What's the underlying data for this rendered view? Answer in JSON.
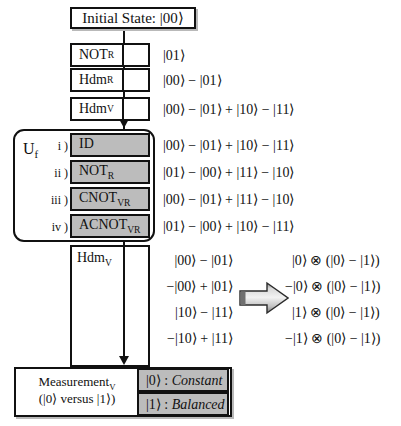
{
  "diagram": {
    "title_box": {
      "label": "Initial State: |00⟩"
    },
    "pipeline_gates": [
      {
        "label": "NOT",
        "sub": "R",
        "state": "|01⟩"
      },
      {
        "label": "Hdm",
        "sub": "R",
        "state": "|00⟩ − |01⟩"
      },
      {
        "label": "Hdm",
        "sub": "V",
        "state": "|00⟩ − |01⟩ + |10⟩ − |11⟩"
      }
    ],
    "uf": {
      "label": "U",
      "label_sub": "f",
      "cases": [
        {
          "roman": "i )",
          "gate": "ID",
          "gate_sub": "",
          "state": "|00⟩ − |01⟩ + |10⟩ − |11⟩"
        },
        {
          "roman": "ii )",
          "gate": "NOT",
          "gate_sub": "R",
          "state": "|01⟩ − |00⟩ + |11⟩ − |10⟩"
        },
        {
          "roman": "iii )",
          "gate": "CNOT",
          "gate_sub": "VR",
          "state": "|00⟩ − |01⟩ + |11⟩ − |10⟩"
        },
        {
          "roman": "iv )",
          "gate": "ACNOT",
          "gate_sub": "VR",
          "state": "|01⟩ − |00⟩ + |10⟩ − |11⟩"
        }
      ]
    },
    "final_hadamard": {
      "label": "Hdm",
      "sub": "V",
      "states": [
        "|00⟩ − |01⟩",
        "−|00⟩ + |01⟩",
        "|10⟩ − |11⟩",
        "−|10⟩ + |11⟩"
      ],
      "factored_states": [
        "|0⟩ ⊗ (|0⟩ − |1⟩)",
        "−|0⟩ ⊗ (|0⟩ − |1⟩)",
        "|1⟩ ⊗ (|0⟩ − |1⟩)",
        "−|1⟩ ⊗ (|0⟩ − |1⟩)"
      ]
    },
    "measurement": {
      "line1": "Measurement",
      "line1_sub": "V",
      "line2": "(|0⟩ versus |1⟩)",
      "outcomes": [
        {
          "ket": "|0⟩",
          "sep": " : ",
          "verdict": "Constant"
        },
        {
          "ket": "|1⟩",
          "sep": " : ",
          "verdict": "Balanced"
        }
      ]
    },
    "colors": {
      "line": "#111111",
      "gate_fill": "#bcbcbc",
      "box_fill": "#ffffff",
      "shadow": "#b9b9b9"
    },
    "icons": {
      "implication_arrow": "block-right-arrow-icon",
      "flow_arrow": "down-arrow-icon"
    }
  }
}
